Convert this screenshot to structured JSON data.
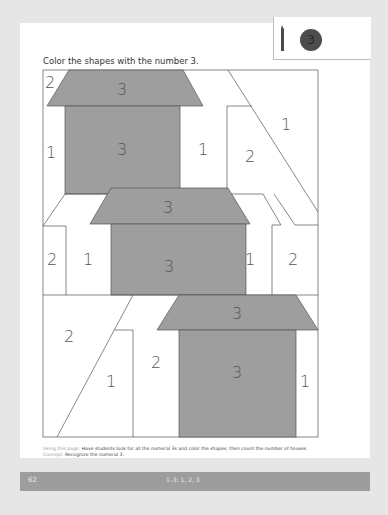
{
  "instruction": "Color the shapes with the number 3.",
  "legend": {
    "tool_icon": "crayon-icon",
    "target_number": "3",
    "target_color": "#4d4d4d"
  },
  "puzzle": {
    "fill_color": "#9e9e9e",
    "line_color": "#555555",
    "labels": [
      {
        "id": "r1-corner",
        "value": "2"
      },
      {
        "id": "roof1",
        "value": "3"
      },
      {
        "id": "top-right",
        "value": "1"
      },
      {
        "id": "left1",
        "value": "1"
      },
      {
        "id": "body1",
        "value": "3"
      },
      {
        "id": "mid1",
        "value": "1"
      },
      {
        "id": "square-right",
        "value": "2"
      },
      {
        "id": "roof2",
        "value": "3"
      },
      {
        "id": "left2a",
        "value": "2"
      },
      {
        "id": "left2b",
        "value": "1"
      },
      {
        "id": "body2",
        "value": "3"
      },
      {
        "id": "right2a",
        "value": "1"
      },
      {
        "id": "right2b",
        "value": "2"
      },
      {
        "id": "roof3",
        "value": "3"
      },
      {
        "id": "bottom-left",
        "value": "2"
      },
      {
        "id": "bottom-tri",
        "value": "1"
      },
      {
        "id": "bottom-mid",
        "value": "2"
      },
      {
        "id": "body3",
        "value": "3"
      },
      {
        "id": "bottom-right",
        "value": "1"
      }
    ]
  },
  "notes": {
    "using_label": "Using this page:",
    "using_text": "Have students look for all the numeral 3s and color the shapes, then count the number of houses.",
    "concept_label": "Concept:",
    "concept_text": "Recognize the numeral 3."
  },
  "footer": {
    "page_number": "62",
    "standard": "1–3: 1, 2, 3"
  }
}
